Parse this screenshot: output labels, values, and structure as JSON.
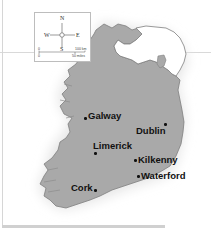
{
  "map": {
    "title": "Ireland",
    "colors": {
      "republic_fill": "#a9a9a9",
      "northern_ireland_fill": "#ffffff",
      "coast_stroke": "#7f7f7f",
      "background": "#ffffff",
      "label": "#111111"
    },
    "compass": {
      "north": "N",
      "south": "S",
      "east": "E",
      "west": "W"
    },
    "scale": {
      "km_start": "0",
      "km_end": "100 km",
      "miles_start": "0",
      "miles_end": "50 miles"
    },
    "cities": [
      {
        "name": "Galway",
        "label_side": "right"
      },
      {
        "name": "Dublin",
        "label_side": "left"
      },
      {
        "name": "Limerick",
        "label_side": "above-right"
      },
      {
        "name": "Kilkenny",
        "label_side": "right"
      },
      {
        "name": "Waterford",
        "label_side": "right"
      },
      {
        "name": "Cork",
        "label_side": "left"
      }
    ]
  }
}
